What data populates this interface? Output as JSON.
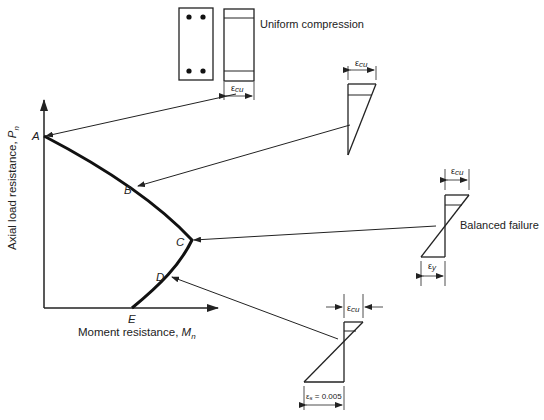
{
  "axes": {
    "y_label": "Axial load resistance, ",
    "y_sym": "P",
    "y_sub": "n",
    "x_label": "Moment resistance, ",
    "x_sym": "M",
    "x_sub": "n"
  },
  "points": {
    "A": "A",
    "B": "B",
    "C": "C",
    "D": "D",
    "E": "E"
  },
  "strain_labels": {
    "uniform": "Uniform compression",
    "balanced": "Balanced failure",
    "ecu_sym": "ε",
    "ecu_sub": "cu",
    "ey_sym": "ε",
    "ey_sub": "y",
    "es_text": "ε",
    "es_sub": "s",
    "es_val": " = 0.005"
  }
}
